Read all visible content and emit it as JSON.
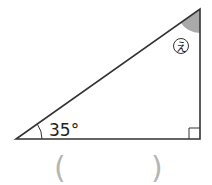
{
  "figure": {
    "type": "right-triangle",
    "given_angle_label": "35°",
    "unknown_angle_label": "え",
    "right_angle_marker": true,
    "answer_open_paren": "(",
    "answer_close_paren": ")",
    "colors": {
      "line": "#333333",
      "shaded_angle": "#a9a9a9",
      "paren": "#b5b5b5"
    }
  }
}
